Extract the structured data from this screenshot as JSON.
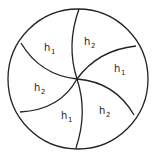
{
  "diagram": {
    "type": "pinwheel-circle",
    "regions": [
      {
        "label": "h",
        "sub": "1",
        "x": 44,
        "y": 51
      },
      {
        "label": "h",
        "sub": "2",
        "x": 84,
        "y": 45
      },
      {
        "label": "h",
        "sub": "1",
        "x": 114,
        "y": 72
      },
      {
        "label": "h",
        "sub": "2",
        "x": 34,
        "y": 91
      },
      {
        "label": "h",
        "sub": "1",
        "x": 61,
        "y": 119
      },
      {
        "label": "h",
        "sub": "2",
        "x": 99,
        "y": 114
      }
    ],
    "colors": {
      "stroke": "#222222",
      "background": "#ffffff"
    }
  }
}
